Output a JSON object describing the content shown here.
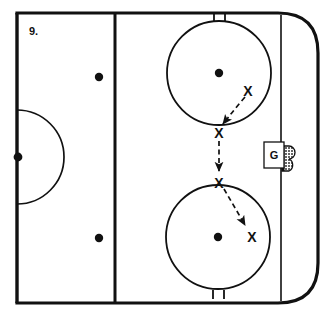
{
  "diagram": {
    "number_label": "9.",
    "colors": {
      "ink": "#111111",
      "ice": "#ffffff",
      "net_fill": "#6e6e6e"
    },
    "rink": {
      "name": "half-ice-hockey-rink",
      "boards_left_x": 17,
      "boards_top_y": 13,
      "boards_right_x": 318,
      "boards_bottom_y": 303,
      "corner_radius": 40,
      "board_stroke_width": 3.2
    },
    "lines": [
      {
        "name": "center-line",
        "orientation": "vertical",
        "x": 17,
        "label": "Center red line"
      },
      {
        "name": "blue-line",
        "orientation": "vertical",
        "x": 115,
        "label": "Blue line"
      },
      {
        "name": "goal-line",
        "orientation": "vertical",
        "x": 281,
        "label": "Goal line"
      }
    ],
    "center_circle": {
      "name": "center-ice-half-circle",
      "cx": 17,
      "cy": 157,
      "r": 47,
      "note": "Half circle opening to the right of the center line"
    },
    "faceoff_dots": [
      {
        "name": "center-ice-dot",
        "cx": 18,
        "cy": 157,
        "r": 4.2
      },
      {
        "name": "neutral-zone-dot-top",
        "cx": 99,
        "cy": 77,
        "r": 4.2
      },
      {
        "name": "neutral-zone-dot-bottom",
        "cx": 99,
        "cy": 238,
        "r": 4.2
      },
      {
        "name": "faceoff-dot-top",
        "cx": 219,
        "cy": 73,
        "r": 4.2
      },
      {
        "name": "faceoff-dot-bottom",
        "cx": 218,
        "cy": 237,
        "r": 4.2
      }
    ],
    "faceoff_circles": [
      {
        "name": "faceoff-circle-top",
        "cx": 219,
        "cy": 73,
        "r": 52,
        "hash_marks": {
          "position": "top",
          "count": 2,
          "length": 9
        }
      },
      {
        "name": "faceoff-circle-bottom",
        "cx": 218,
        "cy": 237,
        "r": 52,
        "hash_marks": {
          "position": "bottom",
          "count": 2,
          "length": 9
        }
      }
    ],
    "goal": {
      "name": "goal-net",
      "net_x": 282,
      "net_y": 146,
      "net_width": 14,
      "net_height": 25,
      "goalie_box": {
        "x": 264,
        "y": 142,
        "width": 20,
        "height": 26
      },
      "goalie_label": "G"
    },
    "players": [
      {
        "name": "player-x-1",
        "label": "X",
        "x": 248,
        "y": 91
      },
      {
        "name": "player-x-2",
        "label": "X",
        "x": 219,
        "y": 133
      },
      {
        "name": "player-x-3",
        "label": "X",
        "x": 219,
        "y": 183
      },
      {
        "name": "player-x-4",
        "label": "X",
        "x": 252,
        "y": 237
      }
    ],
    "movement_paths": [
      {
        "name": "skate-path-1",
        "style": "dashed-arrow",
        "from": "player-x-1",
        "to": "player-x-2",
        "path": "M 245 97 Q 232 112 222 125",
        "description": "Curved skate from upper X down-left to the circle edge"
      },
      {
        "name": "skate-path-2",
        "style": "dashed-arrow",
        "from": "player-x-2",
        "to": "player-x-3",
        "path": "M 219 140 L 219 172",
        "description": "Straight skate down between the two faceoff circles"
      },
      {
        "name": "skate-path-3",
        "style": "dashed-arrow",
        "from": "player-x-3",
        "to": "player-x-4",
        "path": "M 224 188 L 246 226",
        "description": "Straight skate down-right toward the lower X"
      }
    ]
  }
}
